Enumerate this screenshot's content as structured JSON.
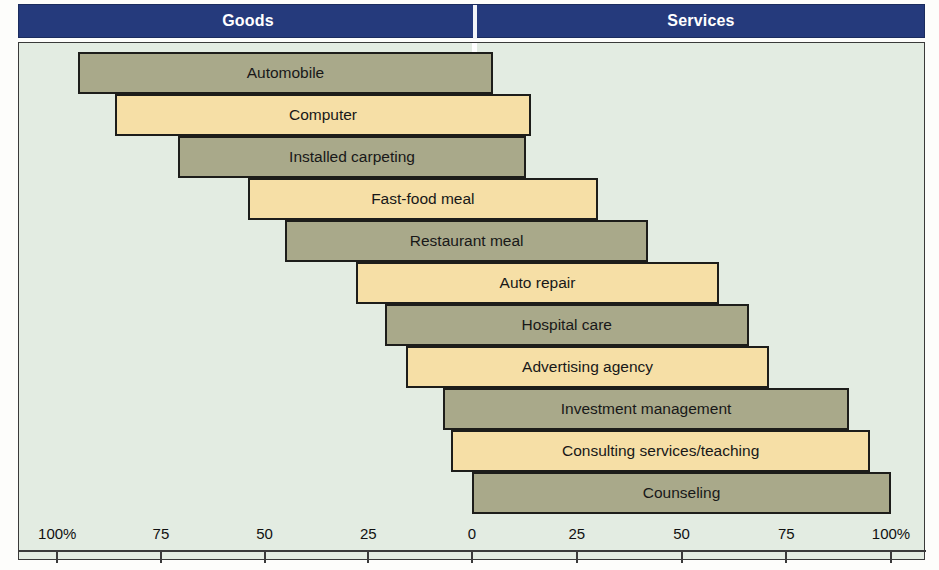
{
  "header": {
    "left_label": "Goods",
    "right_label": "Services",
    "band_color": "#253a7c",
    "text_color": "#ffffff"
  },
  "palette": {
    "background": "#e3ece2",
    "goods_bar": "#a9a98a",
    "services_bar": "#f6dfa6",
    "bar_outline": "#1d1d1a",
    "center_line": "#ffffff"
  },
  "chart_data": {
    "type": "bar",
    "title": "",
    "subtitle": "",
    "xlabel": "",
    "ylabel": "",
    "orientation": "horizontal",
    "layout": "diverging-tangible-intangible",
    "grid": false,
    "legend": "none",
    "center_marker": "dashed white vertical line at 0",
    "axis": {
      "left_section_label": "Goods",
      "right_section_label": "Services",
      "tick_labels": [
        "100%",
        "75",
        "50",
        "25",
        "0",
        "25",
        "50",
        "75",
        "100%"
      ],
      "tick_values": [
        -100,
        -75,
        -50,
        -25,
        0,
        25,
        50,
        75,
        100
      ],
      "xlim": [
        -100,
        100
      ]
    },
    "categories": [
      "Automobile",
      "Computer",
      "Installed carpeting",
      "Fast-food meal",
      "Restaurant meal",
      "Auto repair",
      "Hospital care",
      "Advertising agency",
      "Investment management",
      "Consulting services/teaching",
      "Counseling"
    ],
    "series": [
      {
        "name": "Tangible (goods) share",
        "values": [
          95,
          86,
          71,
          54,
          45,
          28,
          21,
          16,
          7,
          5,
          0
        ]
      },
      {
        "name": "Intangible (services) share",
        "values": [
          5,
          14,
          13,
          30,
          42,
          59,
          66,
          71,
          90,
          95,
          100
        ]
      }
    ],
    "bars": [
      {
        "label": "Automobile",
        "fill": "goods",
        "start_pct": -95,
        "end_pct": 5
      },
      {
        "label": "Computer",
        "fill": "services",
        "start_pct": -86,
        "end_pct": 14
      },
      {
        "label": "Installed carpeting",
        "fill": "goods",
        "start_pct": -71,
        "end_pct": 13
      },
      {
        "label": "Fast-food meal",
        "fill": "services",
        "start_pct": -54,
        "end_pct": 30
      },
      {
        "label": "Restaurant meal",
        "fill": "goods",
        "start_pct": -45,
        "end_pct": 42
      },
      {
        "label": "Auto repair",
        "fill": "services",
        "start_pct": -28,
        "end_pct": 59
      },
      {
        "label": "Hospital care",
        "fill": "goods",
        "start_pct": -21,
        "end_pct": 66
      },
      {
        "label": "Advertising agency",
        "fill": "services",
        "start_pct": -16,
        "end_pct": 71
      },
      {
        "label": "Investment management",
        "fill": "goods",
        "start_pct": -7,
        "end_pct": 90
      },
      {
        "label": "Consulting services/teaching",
        "fill": "services",
        "start_pct": -5,
        "end_pct": 95
      },
      {
        "label": "Counseling",
        "fill": "goods",
        "start_pct": 0,
        "end_pct": 100
      }
    ]
  }
}
